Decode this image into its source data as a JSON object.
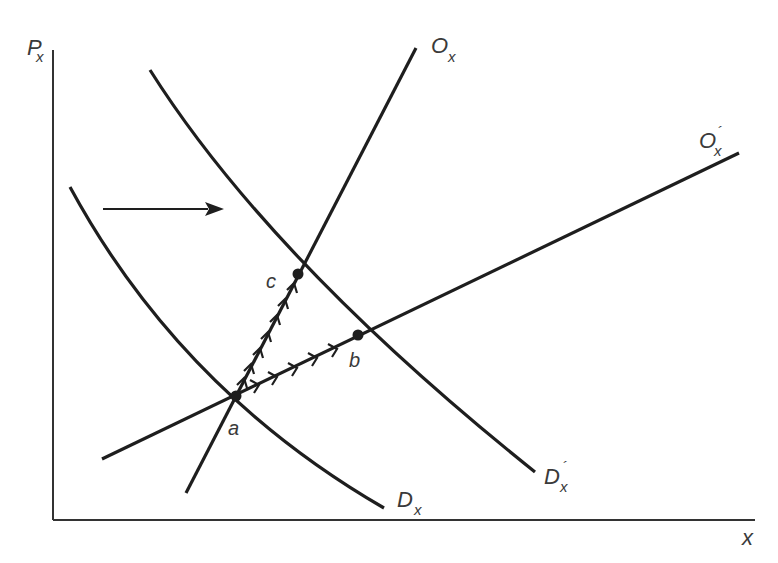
{
  "diagram": {
    "type": "supply-demand-shift",
    "axes": {
      "y_label": "P",
      "y_label_sub": "x",
      "x_label": "x"
    },
    "curves": [
      {
        "id": "Dx",
        "label": "D",
        "sub": "x",
        "prime": "",
        "kind": "demand"
      },
      {
        "id": "Dx_prime",
        "label": "D",
        "sub": "x",
        "prime": "´",
        "kind": "demand"
      },
      {
        "id": "Ox",
        "label": "O",
        "sub": "x",
        "prime": "",
        "kind": "supply"
      },
      {
        "id": "Ox_prime",
        "label": "O",
        "sub": "x",
        "prime": "´",
        "kind": "supply"
      }
    ],
    "points": [
      {
        "id": "a",
        "label": "a"
      },
      {
        "id": "b",
        "label": "b"
      },
      {
        "id": "c",
        "label": "c"
      }
    ],
    "shift_arrow": {
      "direction": "right",
      "meaning": "demand-shift-arrow"
    },
    "paths": [
      {
        "from": "a",
        "to": "c",
        "along": "Ox",
        "marker": "chevron-arrows"
      },
      {
        "from": "a",
        "to": "b",
        "along": "Ox_prime",
        "marker": "chevron-arrows"
      }
    ]
  }
}
